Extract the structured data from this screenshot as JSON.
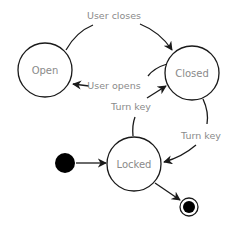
{
  "diagram": {
    "type": "state-machine",
    "states": [
      {
        "id": "open",
        "label": "Open"
      },
      {
        "id": "closed",
        "label": "Closed"
      },
      {
        "id": "locked",
        "label": "Locked"
      }
    ],
    "transitions": [
      {
        "from": "open",
        "to": "closed",
        "label": "User closes"
      },
      {
        "from": "closed",
        "to": "open",
        "label": "User opens"
      },
      {
        "from": "locked",
        "to": "closed",
        "label": "Turn key"
      },
      {
        "from": "closed",
        "to": "locked",
        "label": "Turn key"
      },
      {
        "from": "initial",
        "to": "locked",
        "label": ""
      },
      {
        "from": "locked",
        "to": "final",
        "label": ""
      }
    ],
    "colors": {
      "stroke": "#1a1a1a",
      "text": "#8a8a8a",
      "background": "#ffffff"
    }
  }
}
